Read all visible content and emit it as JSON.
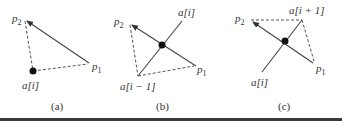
{
  "figure": {
    "panels": [
      {
        "caption": "(a)",
        "labels": {
          "p2": "p",
          "p2_sub": "2",
          "p1": "p",
          "p1_sub": "1",
          "point": "a[i]"
        }
      },
      {
        "caption": "(b)",
        "labels": {
          "p2": "p",
          "p2_sub": "2",
          "p1": "p",
          "p1_sub": "1",
          "upper": "a[i]",
          "lower": "a[i − 1]"
        }
      },
      {
        "caption": "(c)",
        "labels": {
          "p2": "p",
          "p2_sub": "2",
          "p1": "p",
          "p1_sub": "1",
          "upper": "a[i + 1]",
          "lower": "a[i]"
        }
      }
    ],
    "colors": {
      "line": "#444444",
      "dot": "#111111",
      "rule": "#3a3a3a"
    }
  }
}
